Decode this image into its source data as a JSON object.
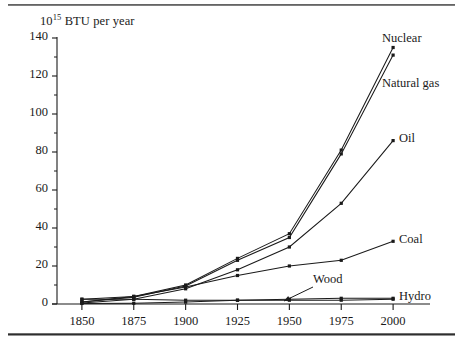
{
  "figure": {
    "ghost_header": "",
    "unit_label_prefix": "10",
    "unit_label_exponent": "15",
    "unit_label_suffix": " BTU per year"
  },
  "chart_data": {
    "type": "line",
    "title": "",
    "subtitle": "",
    "xlabel": "",
    "ylabel": "10^15 BTU per year",
    "categories": [
      1850,
      1875,
      1900,
      1925,
      1950,
      1975,
      2000
    ],
    "tick_labels_x": [
      "1850",
      "1875",
      "1900",
      "1925",
      "1950",
      "1975",
      "2000"
    ],
    "tick_labels_y": [
      "0",
      "20",
      "40",
      "60",
      "80",
      "100",
      "120",
      "140"
    ],
    "xlim": [
      1838,
      2012
    ],
    "ylim": [
      0,
      140
    ],
    "ytick_step": 20,
    "minor_ticks_y": true,
    "grid": false,
    "legend_position": "inline-right-of-line-ends",
    "marker": "square-dot",
    "line_color": "#1a1a1a",
    "series": [
      {
        "name": "Nuclear",
        "label": "Nuclear",
        "values": [
          1,
          4,
          10,
          24,
          37,
          81,
          135
        ],
        "label_x": 382,
        "label_y": 31
      },
      {
        "name": "Natural gas",
        "label": "Natural gas",
        "values": [
          1,
          3.5,
          9.5,
          23,
          35,
          79,
          131
        ],
        "label_x": 382,
        "label_y": 76
      },
      {
        "name": "Oil",
        "label": "Oil",
        "values": [
          0.5,
          2.5,
          8,
          18,
          30,
          53,
          86
        ],
        "label_x": 399,
        "label_y": 131
      },
      {
        "name": "Coal",
        "label": "Coal",
        "values": [
          2.5,
          4,
          9,
          15,
          20,
          23,
          33
        ],
        "label_x": 399,
        "label_y": 232
      },
      {
        "name": "Wood",
        "label": "Wood",
        "values": [
          2.5,
          2.5,
          2,
          2,
          2,
          2,
          2.5
        ],
        "label_x": 313,
        "label_y": 272,
        "annotation_arrow": {
          "from_x": 313,
          "from_y": 287,
          "to_x": 284,
          "to_y": 301
        }
      },
      {
        "name": "Hydro",
        "label": "Hydro",
        "values": [
          0.3,
          0.4,
          1,
          2,
          2.5,
          3,
          3
        ],
        "label_x": 399,
        "label_y": 289
      }
    ]
  }
}
